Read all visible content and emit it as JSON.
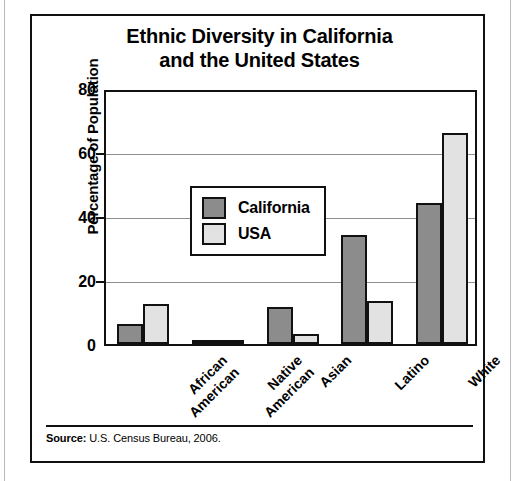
{
  "chart_data": {
    "type": "bar",
    "title": "Ethnic Diversity in California and the United States",
    "title_lines": [
      "Ethnic Diversity in California",
      "and the United States"
    ],
    "categories": [
      "African American",
      "Native American",
      "Asian",
      "Latino",
      "White"
    ],
    "category_lines": [
      [
        "African",
        "American"
      ],
      [
        "Native",
        "American"
      ],
      [
        "Asian"
      ],
      [
        "Latino"
      ],
      [
        "White"
      ]
    ],
    "series": [
      {
        "name": "California",
        "values": [
          6.3,
          1.0,
          11.6,
          34.0,
          44.0
        ],
        "color": "#8c8c8c"
      },
      {
        "name": "USA",
        "values": [
          12.6,
          1.0,
          3.0,
          13.5,
          65.8
        ],
        "color": "#e2e2e2"
      }
    ],
    "xlabel": "",
    "ylabel": "Percentage of Population",
    "ylim": [
      0,
      80
    ],
    "yticks": [
      0,
      20,
      40,
      60,
      80
    ],
    "ytick_labels": [
      "0",
      "20",
      "40",
      "60",
      "80"
    ],
    "grid": true,
    "legend_position": "upper-left-inside"
  },
  "legend": {
    "items": [
      {
        "label": "California",
        "color": "#8c8c8c"
      },
      {
        "label": "USA",
        "color": "#e2e2e2"
      }
    ]
  },
  "source": {
    "label": "Source:",
    "text": " U.S. Census Bureau, 2006."
  }
}
